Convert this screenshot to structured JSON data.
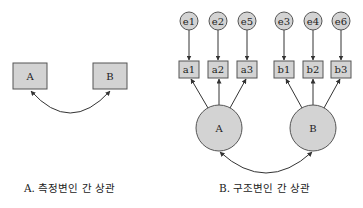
{
  "colors": {
    "node_fill": "#d3d3d3",
    "stroke": "#333333",
    "background": "#ffffff"
  },
  "panel_a": {
    "caption": "A. 측정변인 간 상관",
    "observed": [
      {
        "id": "A",
        "label": "A"
      },
      {
        "id": "B",
        "label": "B"
      }
    ],
    "correlation": {
      "from": "A",
      "to": "B",
      "type": "double-headed-curved-arrow"
    }
  },
  "panel_b": {
    "caption": "B. 구조변인 간 상관",
    "errors": [
      {
        "id": "e1",
        "label": "e1"
      },
      {
        "id": "e2",
        "label": "e2"
      },
      {
        "id": "e5",
        "label": "e5"
      },
      {
        "id": "e3",
        "label": "e3"
      },
      {
        "id": "e4",
        "label": "e4"
      },
      {
        "id": "e6",
        "label": "e6"
      }
    ],
    "indicators": [
      {
        "id": "a1",
        "label": "a1"
      },
      {
        "id": "a2",
        "label": "a2"
      },
      {
        "id": "a3",
        "label": "a3"
      },
      {
        "id": "b1",
        "label": "b1"
      },
      {
        "id": "b2",
        "label": "b2"
      },
      {
        "id": "b3",
        "label": "b3"
      }
    ],
    "latents": [
      {
        "id": "A",
        "label": "A"
      },
      {
        "id": "B",
        "label": "B"
      }
    ],
    "edges": [
      {
        "from": "e1",
        "to": "a1"
      },
      {
        "from": "e2",
        "to": "a2"
      },
      {
        "from": "e5",
        "to": "a3"
      },
      {
        "from": "e3",
        "to": "b1"
      },
      {
        "from": "e4",
        "to": "b2"
      },
      {
        "from": "e6",
        "to": "b3"
      },
      {
        "from": "A",
        "to": "a1"
      },
      {
        "from": "A",
        "to": "a2"
      },
      {
        "from": "A",
        "to": "a3"
      },
      {
        "from": "B",
        "to": "b1"
      },
      {
        "from": "B",
        "to": "b2"
      },
      {
        "from": "B",
        "to": "b3"
      }
    ],
    "correlation": {
      "from": "A",
      "to": "B",
      "type": "double-headed-curved-arrow"
    }
  }
}
